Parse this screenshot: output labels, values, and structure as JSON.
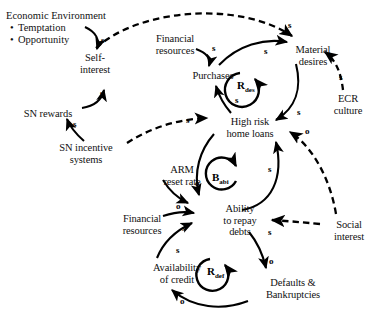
{
  "diagram": {
    "type": "causal-loop-diagram",
    "canvas": {
      "width": 378,
      "height": 325
    },
    "colors": {
      "stroke": "#000000",
      "background": "#ffffff",
      "text": "#111111"
    }
  },
  "environment_box": {
    "title": "Economic Environment",
    "bullets": [
      "Temptation",
      "Opportunity"
    ]
  },
  "nodes": [
    {
      "id": "self_interest",
      "label_lines": [
        "Self-",
        "interest"
      ],
      "x": 60,
      "y": 52,
      "w": 70
    },
    {
      "id": "sn_rewards",
      "label_lines": [
        "SN rewards"
      ],
      "x": 12,
      "y": 108,
      "w": 72
    },
    {
      "id": "sn_incentive",
      "label_lines": [
        "SN incentive",
        "systems"
      ],
      "x": 48,
      "y": 142,
      "w": 76
    },
    {
      "id": "fin_res_top",
      "label_lines": [
        "Financial",
        "resources"
      ],
      "x": 143,
      "y": 33,
      "w": 64
    },
    {
      "id": "purchases",
      "label_lines": [
        "Purchases"
      ],
      "x": 180,
      "y": 70,
      "w": 66
    },
    {
      "id": "material",
      "label_lines": [
        "Material",
        "desires"
      ],
      "x": 282,
      "y": 44,
      "w": 62
    },
    {
      "id": "ecr_culture",
      "label_lines": [
        "ECR",
        "culture"
      ],
      "x": 324,
      "y": 93,
      "w": 48
    },
    {
      "id": "high_risk",
      "label_lines": [
        "High risk",
        "home loans"
      ],
      "x": 213,
      "y": 116,
      "w": 74
    },
    {
      "id": "arm_reset",
      "label_lines": [
        "ARM",
        "reset rate"
      ],
      "x": 151,
      "y": 164,
      "w": 62
    },
    {
      "id": "fin_res_bot",
      "label_lines": [
        "Financial",
        "resources"
      ],
      "x": 110,
      "y": 213,
      "w": 64
    },
    {
      "id": "ability",
      "label_lines": [
        "Ability",
        "to repay",
        "debts"
      ],
      "x": 209,
      "y": 203,
      "w": 62
    },
    {
      "id": "availability",
      "label_lines": [
        "Availability",
        "of credit"
      ],
      "x": 141,
      "y": 262,
      "w": 72
    },
    {
      "id": "defaults",
      "label_lines": [
        "Defaults &",
        "Bankruptcies"
      ],
      "x": 251,
      "y": 277,
      "w": 84
    },
    {
      "id": "social",
      "label_lines": [
        "Social",
        "interest"
      ],
      "x": 323,
      "y": 219,
      "w": 52
    }
  ],
  "loop_labels": [
    {
      "id": "r_des",
      "base": "R",
      "sub": "des",
      "x": 237,
      "y": 80
    },
    {
      "id": "b_abi",
      "base": "B",
      "sub": "abi",
      "x": 212,
      "y": 172
    },
    {
      "id": "r_def",
      "base": "R",
      "sub": "def",
      "x": 207,
      "y": 266
    }
  ],
  "links": [
    {
      "id": "env_to_self",
      "from": "economic_environment",
      "to": "self_interest",
      "sign": "s",
      "style": "solid",
      "sign_x": 101,
      "sign_y": 36
    },
    {
      "id": "snrewards_to_self",
      "from": "sn_rewards",
      "to": "self_interest",
      "sign": "s",
      "style": "solid",
      "sign_x": 100,
      "sign_y": 89
    },
    {
      "id": "snincent_to_snrew",
      "from": "sn_incentive",
      "to": "sn_rewards",
      "sign": "s",
      "style": "solid",
      "sign_x": 73,
      "sign_y": 120
    },
    {
      "id": "snincent_to_highrisk",
      "from": "sn_incentive",
      "to": "high_risk",
      "sign": "s",
      "style": "dashed",
      "sign_x": 186,
      "sign_y": 116
    },
    {
      "id": "self_to_material",
      "from": "self_interest",
      "to": "material",
      "sign": "s",
      "style": "dashed",
      "sign_x": 288,
      "sign_y": 21
    },
    {
      "id": "finres_to_purch",
      "from": "fin_res_top",
      "to": "purchases",
      "sign": "s",
      "style": "solid",
      "sign_x": 212,
      "sign_y": 44
    },
    {
      "id": "purch_to_material",
      "from": "purchases",
      "to": "material",
      "sign": "s",
      "style": "solid",
      "sign_x": 264,
      "sign_y": 47
    },
    {
      "id": "material_to_highrisk",
      "from": "material",
      "to": "high_risk",
      "sign": "s",
      "style": "solid",
      "sign_x": 297,
      "sign_y": 108
    },
    {
      "id": "highrisk_to_purch",
      "from": "high_risk",
      "to": "purchases",
      "sign": "s",
      "style": "solid",
      "sign_x": 235,
      "sign_y": 96
    },
    {
      "id": "ecr_to_material",
      "from": "ecr_culture",
      "to": "material",
      "sign": "s",
      "style": "dashed",
      "sign_x": 339,
      "sign_y": 73
    },
    {
      "id": "social_to_highrisk",
      "from": "social",
      "to": "high_risk",
      "sign": "o",
      "style": "dashed",
      "sign_x": 305,
      "sign_y": 127
    },
    {
      "id": "social_to_ability",
      "from": "social",
      "to": "ability",
      "sign": "s",
      "style": "dashed",
      "sign_x": 268,
      "sign_y": 228
    },
    {
      "id": "arm_to_ability",
      "from": "arm_reset",
      "to": "ability",
      "sign": "o",
      "style": "solid",
      "sign_x": 176,
      "sign_y": 202
    },
    {
      "id": "highrisk_to_ability",
      "from": "high_risk",
      "to": "ability",
      "sign": "o",
      "style": "solid",
      "sign_x": 195,
      "sign_y": 179
    },
    {
      "id": "finres_to_ability",
      "from": "fin_res_bot",
      "to": "ability",
      "sign": "s",
      "style": "solid",
      "sign_x": 182,
      "sign_y": 224
    },
    {
      "id": "avail_to_ability",
      "from": "availability",
      "to": "ability",
      "sign": "s",
      "style": "solid",
      "sign_x": 176,
      "sign_y": 246
    },
    {
      "id": "ability_to_highrisk",
      "from": "ability",
      "to": "high_risk",
      "sign": "s",
      "style": "solid",
      "sign_x": 268,
      "sign_y": 165
    },
    {
      "id": "ability_to_defaults",
      "from": "ability",
      "to": "defaults",
      "sign": "o",
      "style": "solid",
      "sign_x": 269,
      "sign_y": 257
    },
    {
      "id": "defaults_to_avail",
      "from": "defaults",
      "to": "availability",
      "sign": "o",
      "style": "solid",
      "sign_x": 180,
      "sign_y": 297
    }
  ],
  "legend": {
    "sign_same": "s",
    "sign_opposite": "o"
  }
}
